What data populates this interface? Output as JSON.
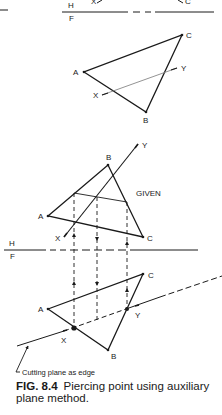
{
  "figure": {
    "number": "FIG. 8.4",
    "caption": "Piercing point using auxiliary plane method."
  },
  "top_fold": {
    "h_label": "H",
    "f_label": "F",
    "x_label": "X",
    "c_label": "C"
  },
  "upper_view": {
    "labels": {
      "a": "A",
      "b": "B",
      "c": "C",
      "x": "X",
      "y": "Y"
    }
  },
  "given_view": {
    "title": "GIVEN",
    "labels": {
      "a": "A",
      "b": "B",
      "c": "C",
      "x": "X",
      "y": "Y"
    }
  },
  "fold_line": {
    "h_label": "H",
    "f_label": "F"
  },
  "lower_view": {
    "labels": {
      "a": "A",
      "b": "B",
      "c": "C",
      "x": "X",
      "y": "Y"
    },
    "leader_text": "Cutting plane as edge"
  },
  "colors": {
    "ink": "#1a1a1a",
    "thin_line": "#777777",
    "background": "#ffffff"
  }
}
